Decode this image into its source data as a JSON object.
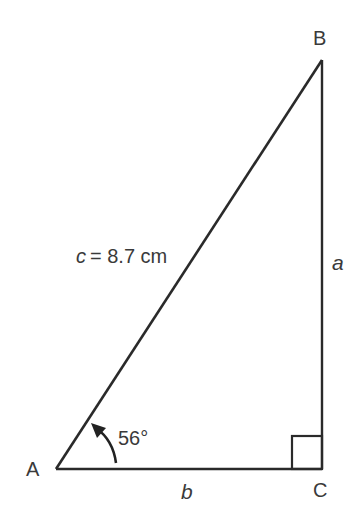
{
  "diagram": {
    "type": "right-triangle",
    "vertices": {
      "A": {
        "label": "A"
      },
      "B": {
        "label": "B"
      },
      "C": {
        "label": "C"
      }
    },
    "sides": {
      "hypotenuse": {
        "var": "c",
        "text": "= 8.7 cm"
      },
      "vertical": {
        "var": "a"
      },
      "horizontal": {
        "var": "b"
      }
    },
    "angle": {
      "at": "A",
      "text": "56°"
    },
    "right_angle_at": "C",
    "colors": {
      "line": "#2a2a2a",
      "text": "#3a3a3a",
      "background": "#ffffff"
    }
  }
}
